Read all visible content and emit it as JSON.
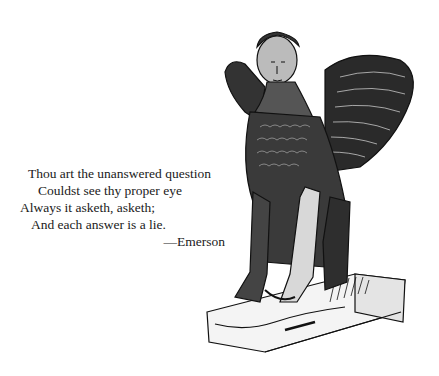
{
  "poem": {
    "lines": [
      "Thou art the unanswered question",
      "Couldst see thy proper eye",
      "Always it asketh, asketh;",
      "And each answer is a lie."
    ],
    "attribution": "—Emerson"
  },
  "illustration": {
    "subject": "winged sphinx statue on pedestal",
    "style": "black-and-white engraving"
  },
  "colors": {
    "background": "#ffffff",
    "ink": "#1a1a1a"
  }
}
